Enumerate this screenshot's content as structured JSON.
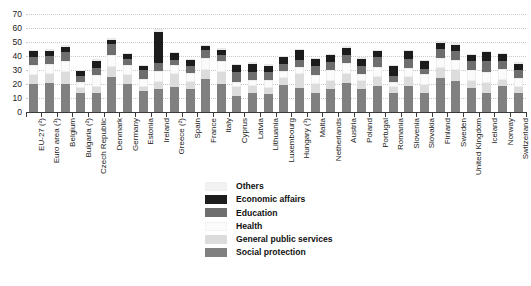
{
  "chart_data": {
    "type": "bar",
    "stacked": true,
    "title": "",
    "subtitle": "",
    "xlabel": "",
    "ylabel": "",
    "ylim": [
      0,
      70
    ],
    "yticks": [
      0,
      10,
      20,
      30,
      40,
      50,
      60,
      70
    ],
    "grid": true,
    "legend_position": "bottom-center",
    "legend_order": [
      "Others",
      "Economic affairs",
      "Education",
      "Health",
      "General public services",
      "Social protection"
    ],
    "series_order_bottom_to_top": [
      "Social protection",
      "General public services",
      "Health",
      "Education",
      "Economic affairs",
      "Others"
    ],
    "colors": {
      "Others": "#f2f2f2",
      "Economic affairs": "#1c1c1c",
      "Education": "#6e6e6e",
      "Health": "#fbfbfb",
      "General public services": "#dcdcdc",
      "Social protection": "#808080"
    },
    "categories": [
      "EU-27 (²)",
      "Euro area (¹)",
      "Belgium",
      "Bulgaria (²)",
      "Czech Republic",
      "Denmark",
      "Germany",
      "Estonia",
      "Ireland",
      "Greece (²)",
      "Spain",
      "France",
      "Italy",
      "Cyprus",
      "Latvia",
      "Lithuania",
      "Luxembourg",
      "Hungary (¹)",
      "Malta",
      "Netherlands",
      "Austria",
      "Poland",
      "Portugal",
      "Romania",
      "Slovenia",
      "Slovakia",
      "Finland",
      "Sweden",
      "United Kingdom",
      "Iceland",
      "Norway",
      "Switzerland"
    ],
    "category_footnotes": [
      "EU-27",
      "Euro area",
      "Belgium",
      "Bulgaria",
      "Czech Republic",
      "Denmark",
      "Germany",
      "Estonia",
      "Ireland",
      "Greece",
      "Spain",
      "France",
      "Italy",
      "Cyprus",
      "Latvia",
      "Lithuania",
      "Luxembourg",
      "Hungary",
      "Malta",
      "Netherlands",
      "Austria",
      "Poland",
      "Portugal",
      "Romania",
      "Slovenia",
      "Slovakia",
      "Finland",
      "Sweden",
      "United Kingdom",
      "Iceland",
      "Norway",
      "Switzerland"
    ],
    "series": [
      {
        "name": "Social protection",
        "color": "#808080",
        "values": [
          19.9,
          20.4,
          20.0,
          13.6,
          13.6,
          25.3,
          20.1,
          14.9,
          16.7,
          17.6,
          16.3,
          23.6,
          20.2,
          11.4,
          13.5,
          12.8,
          19.6,
          17.4,
          13.9,
          16.6,
          20.4,
          16.3,
          18.5,
          13.5,
          18.5,
          13.3,
          24.4,
          22.5,
          17.0,
          13.5,
          18.8,
          13.4
        ]
      },
      {
        "name": "General public services",
        "color": "#dcdcdc",
        "values": [
          6.5,
          6.7,
          8.6,
          3.6,
          4.6,
          6.9,
          6.2,
          3.1,
          5.0,
          9.9,
          5.0,
          6.5,
          8.6,
          6.6,
          5.0,
          4.7,
          4.9,
          9.4,
          6.4,
          5.7,
          6.7,
          5.6,
          6.6,
          4.4,
          6.2,
          6.1,
          6.9,
          7.4,
          5.1,
          7.3,
          4.4,
          4.6
        ]
      },
      {
        "name": "Health",
        "color": "#fbfbfb",
        "values": [
          7.4,
          7.5,
          7.9,
          4.5,
          8.3,
          8.2,
          7.1,
          5.4,
          7.8,
          5.9,
          6.5,
          8.2,
          7.3,
          3.1,
          4.1,
          5.4,
          4.7,
          5.1,
          5.8,
          7.6,
          8.0,
          5.1,
          7.2,
          3.9,
          6.6,
          7.6,
          7.0,
          7.0,
          8.1,
          7.9,
          7.2,
          6.6
        ]
      },
      {
        "name": "Education",
        "color": "#6e6e6e",
        "values": [
          5.5,
          5.1,
          6.3,
          4.0,
          5.2,
          7.9,
          4.4,
          6.7,
          5.8,
          4.1,
          4.8,
          5.8,
          4.7,
          7.3,
          6.0,
          5.4,
          5.1,
          5.4,
          6.5,
          5.6,
          5.6,
          5.6,
          7.0,
          4.2,
          6.6,
          4.1,
          6.4,
          6.9,
          6.2,
          7.9,
          6.2,
          5.5
        ]
      },
      {
        "name": "Economic affairs",
        "color": "#1c1c1c",
        "values": [
          4.1,
          4.0,
          4.0,
          3.7,
          5.1,
          3.3,
          3.6,
          3.0,
          22.0,
          4.4,
          4.4,
          3.0,
          3.7,
          5.0,
          5.8,
          4.8,
          5.0,
          6.8,
          5.1,
          5.2,
          5.2,
          5.5,
          4.0,
          6.6,
          5.4,
          5.2,
          4.8,
          4.4,
          4.4,
          6.2,
          4.7,
          4.4
        ]
      },
      {
        "name": "Others",
        "color": "#f2f2f2",
        "values": [
          1.2,
          1.2,
          1.3,
          0.8,
          0.9,
          1.0,
          1.1,
          0.6,
          1.8,
          1.2,
          1.0,
          1.1,
          1.0,
          1.0,
          1.2,
          1.0,
          1.0,
          1.0,
          1.0,
          1.1,
          1.2,
          1.0,
          1.2,
          0.9,
          1.0,
          1.0,
          1.1,
          1.1,
          1.0,
          1.1,
          1.0,
          0.9
        ]
      }
    ],
    "totals": [
      44.6,
      44.9,
      48.1,
      30.2,
      37.7,
      52.6,
      42.5,
      33.7,
      59.1,
      43.1,
      38.0,
      48.2,
      45.5,
      34.4,
      35.6,
      34.1,
      40.3,
      45.1,
      38.7,
      41.8,
      47.1,
      39.1,
      44.5,
      33.5,
      44.3,
      37.3,
      50.6,
      49.3,
      41.8,
      43.9,
      42.3,
      35.4
    ]
  },
  "legend": {
    "items": [
      {
        "label": "Others",
        "color": "#f2f2f2"
      },
      {
        "label": "Economic affairs",
        "color": "#1c1c1c"
      },
      {
        "label": "Education",
        "color": "#6e6e6e"
      },
      {
        "label": "Health",
        "color": "#fbfbfb"
      },
      {
        "label": "General public services",
        "color": "#dcdcdc"
      },
      {
        "label": "Social protection",
        "color": "#808080"
      }
    ]
  }
}
